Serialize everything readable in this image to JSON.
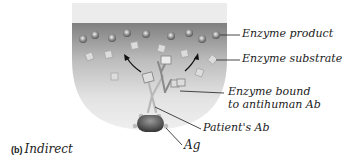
{
  "diagram": {
    "panel_letter": "(b)",
    "panel_label": "Indirect",
    "labels": {
      "enzyme_product": "Enzyme product",
      "enzyme_substrate": "Enzyme substrate",
      "enzyme_bound_line1": "Enzyme bound",
      "enzyme_bound_line2": "to antihuman Ab",
      "patients_ab": "Patient's Ab",
      "antigen": "Ag"
    },
    "colors": {
      "well_rim": "#e9e9e9",
      "well_top": "#8c8c8c",
      "well_bottom": "#ededed",
      "product": "#9a9a9a",
      "substrate": "#d8d8d8",
      "antigen": "#555555",
      "leader_line": "#333333"
    }
  }
}
